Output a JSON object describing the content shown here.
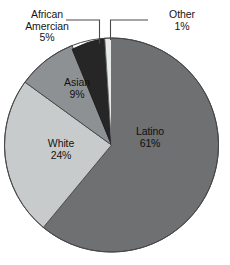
{
  "figure": {
    "type": "pie-chart",
    "background_color": "#ffffff",
    "text_color": "#141414",
    "leader_line_color": "#4a4a4a",
    "outline_color": "#3c3c3c"
  },
  "chart_data": {
    "type": "pie",
    "title": "",
    "subtitle": "",
    "xlabel": "",
    "ylabel": "",
    "grid": false,
    "legend_position": "none",
    "label_format": "name + percent",
    "start_angle_deg": 0,
    "direction": "clockwise",
    "categories": [
      "Latino",
      "White",
      "Asian",
      "African Amercian",
      "Other"
    ],
    "values": [
      61,
      24,
      9,
      5,
      1
    ],
    "value_unit": "percent",
    "total": 100,
    "colors": [
      "#6e7072",
      "#c8cbcb",
      "#8e9193",
      "#262626",
      "#e8eaea"
    ],
    "slices": [
      {
        "name": "Latino",
        "value": 61,
        "value_label": "61%",
        "color": "#6e7072",
        "label_placement": "inside",
        "start_deg": 0,
        "end_deg": 219.6
      },
      {
        "name": "White",
        "value": 24,
        "value_label": "24%",
        "color": "#c8cbcb",
        "label_placement": "inside",
        "start_deg": 219.6,
        "end_deg": 306.0
      },
      {
        "name": "Asian",
        "value": 9,
        "value_label": "9%",
        "color": "#8e9193",
        "label_placement": "inside",
        "start_deg": 306.0,
        "end_deg": 338.4
      },
      {
        "name": "African Amercian",
        "value": 5,
        "value_label": "5%",
        "color": "#262626",
        "label_placement": "outside-callout",
        "start_deg": 338.4,
        "end_deg": 356.4
      },
      {
        "name": "Other",
        "value": 1,
        "value_label": "1%",
        "color": "#e8eaea",
        "label_placement": "outside-callout",
        "start_deg": 356.4,
        "end_deg": 360.0
      }
    ]
  },
  "labels": {
    "latino": {
      "name": "Latino",
      "percent": "61%"
    },
    "white": {
      "name": "White",
      "percent": "24%"
    },
    "asian": {
      "name": "Asian",
      "percent": "9%"
    },
    "african_american": {
      "name_line1": "African",
      "name_line2": "Amercian",
      "percent": "5%"
    },
    "other": {
      "name": "Other",
      "percent": "1%"
    }
  }
}
